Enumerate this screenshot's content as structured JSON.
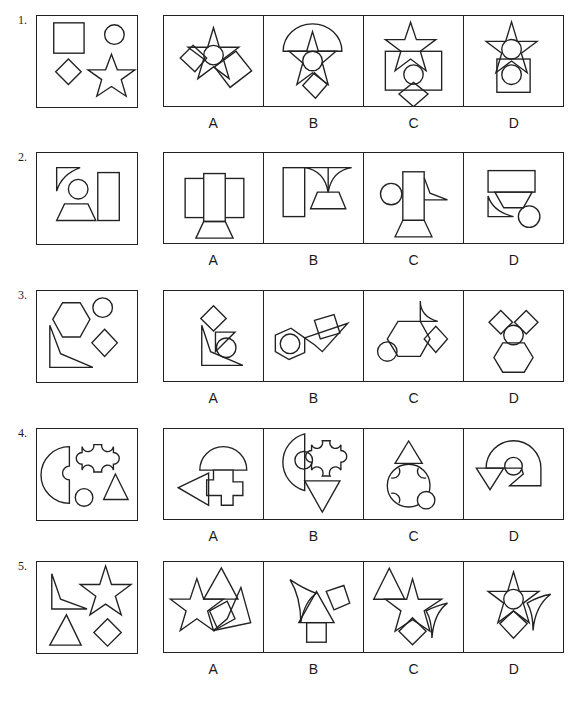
{
  "document": {
    "type": "figure-reasoning-questions",
    "option_labels": [
      "A",
      "B",
      "C",
      "D"
    ],
    "questions": [
      {
        "number": "1.",
        "given": [
          "square",
          "circle",
          "diamond",
          "five-point-star"
        ],
        "options": [
          {
            "label": "A",
            "content": "star with circle, diamond and tilted rectangle overlapping"
          },
          {
            "label": "B",
            "content": "semicircle on top, star with circle, diamond below"
          },
          {
            "label": "C",
            "content": "star above rectangle, circle and diamond below"
          },
          {
            "label": "D",
            "content": "star with circle on top of rectangle containing circle"
          }
        ]
      },
      {
        "number": "2.",
        "given": [
          "concave-triangle",
          "circle",
          "trapezoid",
          "tall-rectangle"
        ],
        "options": [
          {
            "label": "A",
            "content": "three rectangles with trapezoid below"
          },
          {
            "label": "B",
            "content": "rectangle, concave-triangle pair and trapezoid"
          },
          {
            "label": "C",
            "content": "circle, tall rectangle, flag shape, trapezoid"
          },
          {
            "label": "D",
            "content": "rectangle, trapezoid, concave-triangle, circle"
          }
        ]
      },
      {
        "number": "3.",
        "given": [
          "hexagon",
          "circle",
          "diamond",
          "concave-quadrilateral"
        ],
        "options": [
          {
            "label": "A",
            "content": "diamond, concave shape, triangle, circle"
          },
          {
            "label": "B",
            "content": "hexagon with circle, square, concave shape"
          },
          {
            "label": "C",
            "content": "circle, hexagon, concave triangle, diamond"
          },
          {
            "label": "D",
            "content": "two diamonds, circle, hexagon"
          }
        ]
      },
      {
        "number": "4.",
        "given": [
          "notched-semicircle",
          "notched-cross",
          "circle",
          "triangle"
        ],
        "options": [
          {
            "label": "A",
            "content": "semicircle arch, cross, triangle pointing left"
          },
          {
            "label": "B",
            "content": "half-disc, circle, notched cross, inverted triangle"
          },
          {
            "label": "C",
            "content": "triangle on notched circle, small circle"
          },
          {
            "label": "D",
            "content": "semicircle, circle, inverted triangle, Z shape"
          }
        ]
      },
      {
        "number": "5.",
        "given": [
          "concave-quadrilateral",
          "five-point-star",
          "triangle",
          "diamond"
        ],
        "options": [
          {
            "label": "A",
            "content": "star, triangle, square, concave quadrilateral"
          },
          {
            "label": "B",
            "content": "concave triangle, triangle, square, small square"
          },
          {
            "label": "C",
            "content": "triangle, star, diamond, concave triangle"
          },
          {
            "label": "D",
            "content": "star with circle, diamond, concave triangle"
          }
        ]
      }
    ]
  }
}
